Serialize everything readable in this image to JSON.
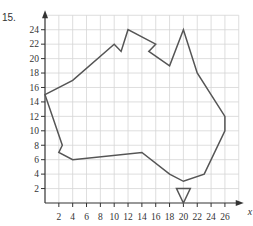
{
  "question_number": "15.",
  "colors": {
    "grid": "#d6d6d6",
    "axis": "#333333",
    "outline": "#555555"
  },
  "chart_data": {
    "type": "line",
    "title": "",
    "xlabel": "x",
    "ylabel": "",
    "xlim": [
      0,
      28
    ],
    "ylim": [
      0,
      26
    ],
    "grid": true,
    "grid_step": 2,
    "x_ticks": [
      2,
      4,
      6,
      8,
      10,
      12,
      14,
      16,
      18,
      20,
      22,
      24,
      26
    ],
    "y_ticks": [
      2,
      4,
      6,
      8,
      10,
      12,
      14,
      16,
      18,
      20,
      22,
      24
    ],
    "series": [
      {
        "name": "mainland-outline",
        "closed": true,
        "points": [
          [
            0,
            15
          ],
          [
            4,
            17
          ],
          [
            10,
            22
          ],
          [
            11,
            21
          ],
          [
            12,
            24
          ],
          [
            16,
            22
          ],
          [
            15,
            21
          ],
          [
            18,
            19
          ],
          [
            20,
            24
          ],
          [
            22,
            18
          ],
          [
            26,
            12
          ],
          [
            26,
            10
          ],
          [
            23,
            4
          ],
          [
            20,
            3
          ],
          [
            18,
            4
          ],
          [
            14,
            7
          ],
          [
            4,
            6
          ],
          [
            2,
            7
          ],
          [
            2.5,
            8
          ]
        ]
      },
      {
        "name": "island-triangle",
        "closed": true,
        "points": [
          [
            19,
            2
          ],
          [
            21,
            2
          ],
          [
            20,
            0
          ]
        ]
      }
    ]
  }
}
